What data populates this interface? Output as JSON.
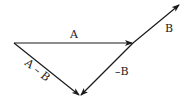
{
  "diagram": {
    "type": "vector-subtraction",
    "vectors": [
      {
        "id": "A",
        "label": "A",
        "from": [
          14,
          43
        ],
        "to": [
          133,
          43
        ]
      },
      {
        "id": "B",
        "label": "B",
        "from": [
          133,
          43
        ],
        "to": [
          180,
          4
        ]
      },
      {
        "id": "negB",
        "label": "–B",
        "from": [
          133,
          43
        ],
        "to": [
          80,
          96
        ]
      },
      {
        "id": "AminusB",
        "label": "A – B",
        "from": [
          14,
          43
        ],
        "to": [
          80,
          96
        ]
      }
    ],
    "labels": {
      "A": "A",
      "B": "B",
      "negB": "–B",
      "AminusB": "A – B"
    },
    "color": "#1a1a1a"
  }
}
